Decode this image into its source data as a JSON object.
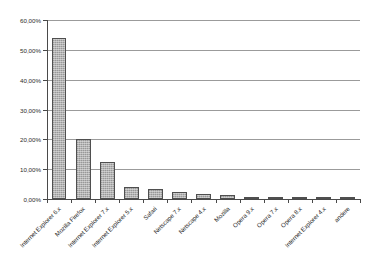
{
  "chart_data": {
    "type": "bar",
    "title": "",
    "xlabel": "",
    "ylabel": "",
    "ylim": [
      0,
      60
    ],
    "grid": true,
    "legend": false,
    "y_tick_labels": [
      "0,00%",
      "10,00%",
      "20,00%",
      "30,00%",
      "40,00%",
      "50,00%",
      "60,00%"
    ],
    "y_tick_values": [
      0,
      10,
      20,
      30,
      40,
      50,
      60
    ],
    "categories": [
      "Internet Explorer 6.x",
      "Mozilla Firefox",
      "Internet Explorer 7.x",
      "Internet Explorer 5.x",
      "Safari",
      "Netscape 7.x",
      "Netscape 4.x",
      "Mozilla",
      "Opera 9.x",
      "Opera 7.x",
      "Opera 8.x",
      "Internet Explorer 4.x",
      "andere"
    ],
    "values": [
      54.0,
      20.0,
      12.4,
      4.0,
      3.2,
      2.4,
      1.6,
      1.5,
      0.7,
      0.5,
      0.3,
      0.2,
      0.8
    ],
    "value_labels": [
      "54,00%",
      "20,00%",
      "12,40%",
      "4,00%",
      "3,20%",
      "2,40%",
      "1,60%",
      "1,50%",
      "0,70%",
      "0,50%",
      "0,30%",
      "0,20%",
      "0,80%"
    ],
    "bar_color": "#a9a9a9",
    "bar_border_color": "#4f4f4f",
    "grid_color": "#9b9b9b",
    "axis_color": "#4a4a4a",
    "background_color": "#ffffff"
  }
}
